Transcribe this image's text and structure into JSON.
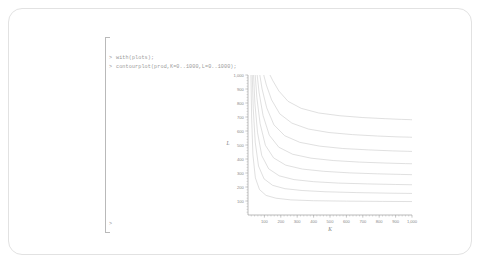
{
  "application": {
    "name": "Maple Worksheet",
    "prompt_symbol": ">"
  },
  "worksheet": {
    "input_lines": [
      {
        "prompt": ">",
        "code": "with(plots);"
      },
      {
        "prompt": ">",
        "code": "contourplot(prod,K=0..1000,L=0..1000);"
      },
      {
        "prompt": ">",
        "code": ""
      }
    ]
  },
  "chart_data": {
    "type": "line",
    "title": "",
    "subtitle": "",
    "xlabel": "K",
    "ylabel": "L",
    "xlim": [
      0,
      1000
    ],
    "ylim": [
      0,
      1000
    ],
    "grid": false,
    "legend": "none",
    "annotation": "Contour plot (isoquants) of production function prod over K=0..1000, L=0..1000",
    "x_ticks": [
      "100",
      "200",
      "300",
      "400",
      "500",
      "600",
      "700",
      "800",
      "900",
      "1,000"
    ],
    "x_tick_values": [
      100,
      200,
      300,
      400,
      500,
      600,
      700,
      800,
      900,
      1000
    ],
    "y_ticks": [
      "100",
      "200",
      "300",
      "400",
      "500",
      "600",
      "700",
      "800",
      "900",
      "1,000"
    ],
    "y_tick_values": [
      100,
      200,
      300,
      400,
      500,
      600,
      700,
      800,
      900,
      1000
    ],
    "minor_ticks_per_interval": 4,
    "curve_color": "#c6c6c6",
    "axis_color": "#8d8d8d",
    "series": [
      {
        "name": "contour-1",
        "level": 1,
        "x": [
          18,
          22,
          30,
          45,
          70,
          110,
          170,
          260,
          400,
          600,
          820,
          1000
        ],
        "y": [
          1000,
          700,
          430,
          265,
          182,
          140,
          120,
          108,
          102,
          99,
          97,
          96
        ]
      },
      {
        "name": "contour-2",
        "level": 2,
        "x": [
          26,
          32,
          44,
          64,
          98,
          150,
          225,
          330,
          470,
          660,
          860,
          1000
        ],
        "y": [
          1000,
          760,
          520,
          350,
          258,
          212,
          188,
          175,
          166,
          160,
          156,
          154
        ]
      },
      {
        "name": "contour-3",
        "level": 3,
        "x": [
          34,
          42,
          58,
          84,
          126,
          190,
          280,
          400,
          550,
          730,
          900,
          1000
        ],
        "y": [
          1000,
          800,
          590,
          424,
          330,
          280,
          253,
          238,
          228,
          222,
          218,
          216
        ]
      },
      {
        "name": "contour-4",
        "level": 4,
        "x": [
          44,
          54,
          74,
          106,
          156,
          230,
          332,
          462,
          618,
          790,
          930,
          1000
        ],
        "y": [
          1000,
          838,
          652,
          498,
          408,
          356,
          328,
          312,
          301,
          294,
          290,
          288
        ]
      },
      {
        "name": "contour-5",
        "level": 5,
        "x": [
          56,
          68,
          92,
          130,
          188,
          272,
          384,
          520,
          678,
          840,
          960,
          1000
        ],
        "y": [
          1000,
          872,
          710,
          570,
          484,
          434,
          406,
          389,
          378,
          371,
          367,
          366
        ]
      },
      {
        "name": "contour-6",
        "level": 6,
        "x": [
          72,
          86,
          114,
          158,
          224,
          316,
          436,
          578,
          736,
          880,
          975,
          1000
        ],
        "y": [
          1000,
          900,
          766,
          644,
          566,
          519,
          492,
          475,
          465,
          458,
          455,
          454
        ]
      },
      {
        "name": "contour-7",
        "level": 7,
        "x": [
          96,
          112,
          144,
          194,
          268,
          368,
          494,
          638,
          790,
          915,
          985,
          1000
        ],
        "y": [
          1000,
          928,
          822,
          722,
          656,
          614,
          589,
          574,
          564,
          558,
          556,
          555
        ]
      },
      {
        "name": "contour-8",
        "level": 8,
        "x": [
          134,
          152,
          188,
          244,
          324,
          430,
          560,
          700,
          836,
          935,
          990,
          1000
        ],
        "y": [
          1000,
          958,
          886,
          812,
          762,
          729,
          709,
          696,
          688,
          683,
          681,
          680
        ]
      }
    ]
  }
}
